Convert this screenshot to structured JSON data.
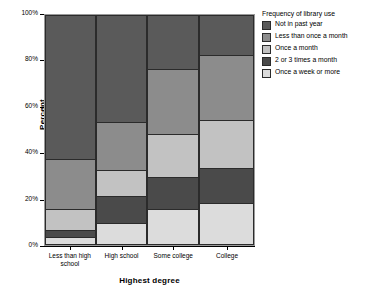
{
  "chart_data": {
    "type": "bar",
    "subtype": "stacked-100-percent-spineplot",
    "title": "",
    "xlabel": "Highest degree",
    "ylabel": "Percent",
    "ylim": [
      0,
      100
    ],
    "yticks": [
      "0%",
      "20%",
      "40%",
      "60%",
      "80%",
      "100%"
    ],
    "ytick_values": [
      0,
      20,
      40,
      60,
      80,
      100
    ],
    "grid": false,
    "legend_position": "right",
    "legend_title": "Frequency of library use",
    "categories": [
      "Less than high school",
      "High school",
      "Some college",
      "College"
    ],
    "category_widths_pct": [
      24.5,
      24.5,
      24.5,
      26.5
    ],
    "series": [
      {
        "name": "Not in past year",
        "color": "#5a5a5a",
        "values": [
          63,
          47,
          24,
          18
        ]
      },
      {
        "name": "Less than once a month",
        "color": "#8c8c8c",
        "values": [
          22,
          21,
          28,
          28
        ]
      },
      {
        "name": "Once a month",
        "color": "#c2c2c2",
        "values": [
          9,
          11,
          19,
          21
        ]
      },
      {
        "name": "2 or 3 times a month",
        "color": "#4a4a4a",
        "values": [
          3,
          12,
          14,
          15
        ]
      },
      {
        "name": "Once a week or more",
        "color": "#dcdcdc",
        "values": [
          3,
          9,
          15,
          18
        ]
      }
    ]
  },
  "axes": {
    "y": {
      "title": "Percent",
      "ticks": [
        {
          "label": "100%",
          "value": 100
        },
        {
          "label": "80%",
          "value": 80
        },
        {
          "label": "60%",
          "value": 60
        },
        {
          "label": "40%",
          "value": 40
        },
        {
          "label": "20%",
          "value": 20
        },
        {
          "label": "0%",
          "value": 0
        }
      ]
    },
    "x": {
      "title": "Highest degree",
      "ticks": [
        {
          "label": "Less than high school"
        },
        {
          "label": "High school"
        },
        {
          "label": "Some college"
        },
        {
          "label": "College"
        }
      ]
    }
  },
  "legend": {
    "title": "Frequency of library use",
    "items": [
      {
        "label": "Not in past year",
        "color": "#5a5a5a"
      },
      {
        "label": "Less than once a month",
        "color": "#8c8c8c"
      },
      {
        "label": "Once a month",
        "color": "#c2c2c2"
      },
      {
        "label": "2 or 3 times a month",
        "color": "#4a4a4a"
      },
      {
        "label": "Once a week or more",
        "color": "#dcdcdc"
      }
    ]
  },
  "colors": {
    "plot_background": "#ebebeb",
    "plot_border": "#9a9a9a",
    "segment_border": "#2b2b2b",
    "page_background": "#ffffff",
    "text": "#000000"
  }
}
